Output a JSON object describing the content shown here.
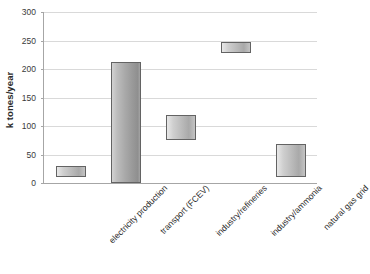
{
  "chart_data": {
    "type": "bar",
    "title": "",
    "subtitle": "",
    "xlabel": "",
    "ylabel": "k tones/year",
    "ylim": [
      0,
      300
    ],
    "ytick_values": [
      0,
      50,
      100,
      150,
      200,
      250,
      300
    ],
    "ytick_labels": [
      "0",
      "50",
      "100",
      "150",
      "200",
      "250",
      "300"
    ],
    "grid": true,
    "legend": false,
    "legend_position": "none",
    "bar_style": "floating-range",
    "categories": [
      "electricity production",
      "transport (FCEV)",
      "industry/refineries",
      "industry/ammonia",
      "natural gas grid"
    ],
    "series": [
      {
        "name": "hydrogen demand range",
        "low": [
          10,
          0,
          75,
          228,
          10
        ],
        "high": [
          30,
          212,
          120,
          248,
          68
        ]
      }
    ],
    "values": [
      30,
      212,
      120,
      248,
      68
    ],
    "annotations": []
  },
  "axis": {
    "y_title": "k tones/year"
  },
  "caption": {
    "text": ""
  },
  "colors": {
    "bar_fill": "#b9b9b9",
    "bar_border": "#636363",
    "gridline": "#d9d9d9",
    "axis": "#a6a6a6",
    "text": "#2b2b2b"
  }
}
